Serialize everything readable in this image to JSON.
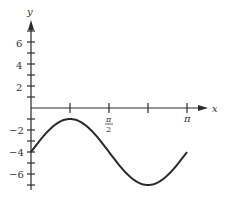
{
  "chart_data": {
    "type": "line",
    "title": "",
    "xlabel": "x",
    "ylabel": "y",
    "function": "y = 3 sin(2x) - 4",
    "xlim": [
      0,
      3.1416
    ],
    "ylim": [
      -7,
      7
    ],
    "x_ticks": [
      0.7854,
      1.5708,
      2.3562,
      3.1416
    ],
    "x_tick_labels": [
      "",
      "π/2",
      "",
      "π"
    ],
    "y_ticks": [
      -7,
      -6,
      -5,
      -4,
      -3,
      -2,
      -1,
      1,
      2,
      3,
      4,
      5,
      6,
      7
    ],
    "y_tick_labels": {
      "6": "6",
      "4": "4",
      "2": "2",
      "-2": "−2",
      "-4": "−4",
      "-6": "−6"
    },
    "grid": false,
    "legend": null,
    "series": [
      {
        "name": "y = 3sin(2x) - 4",
        "x": [
          0,
          0.3927,
          0.7854,
          1.1781,
          1.5708,
          1.9635,
          2.3562,
          2.7489,
          3.1416
        ],
        "values": [
          -4,
          -1.88,
          -1,
          -1.88,
          -4,
          -6.12,
          -7,
          -6.12,
          -4
        ]
      }
    ]
  },
  "labels": {
    "x_axis": "x",
    "y_axis": "y",
    "pi_half_num": "π",
    "pi_half_den": "2",
    "pi": "π",
    "y6": "6",
    "y4": "4",
    "y2": "2",
    "yn2": "−2",
    "yn4": "−4",
    "yn6": "−6"
  }
}
